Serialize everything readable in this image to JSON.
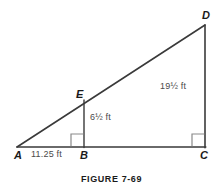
{
  "figure": {
    "caption": "FIGURE 7-69",
    "colors": {
      "line": "#3a3a3a",
      "label_text": "#1a1a1a",
      "dimension_text": "#4a4a4a",
      "right_angle": "#7a7a7a",
      "background": "#ffffff"
    },
    "vertices": [
      {
        "name": "A",
        "label": "A",
        "x": 17,
        "y": 147
      },
      {
        "name": "B",
        "label": "B",
        "x": 84,
        "y": 147
      },
      {
        "name": "C",
        "label": "C",
        "x": 205,
        "y": 147
      },
      {
        "name": "D",
        "label": "D",
        "x": 205,
        "y": 25
      },
      {
        "name": "E",
        "label": "E",
        "x": 84,
        "y": 100
      }
    ],
    "dimensions": [
      {
        "name": "AB",
        "label": "11.25 ft",
        "value": 11.25,
        "unit": "ft"
      },
      {
        "name": "EB",
        "label": "6½ ft",
        "value": 6.5,
        "unit": "ft"
      },
      {
        "name": "DC",
        "label": "19½ ft",
        "value": 19.5,
        "unit": "ft"
      }
    ],
    "right_angles": [
      {
        "at": "B",
        "label": "right-angle-marker-b"
      },
      {
        "at": "C",
        "label": "right-angle-marker-c"
      }
    ],
    "segments": [
      {
        "name": "AD",
        "from": "A",
        "to": "D"
      },
      {
        "name": "AC",
        "from": "A",
        "to": "C"
      },
      {
        "name": "DC",
        "from": "D",
        "to": "C"
      },
      {
        "name": "EB",
        "from": "E",
        "to": "B"
      }
    ]
  }
}
